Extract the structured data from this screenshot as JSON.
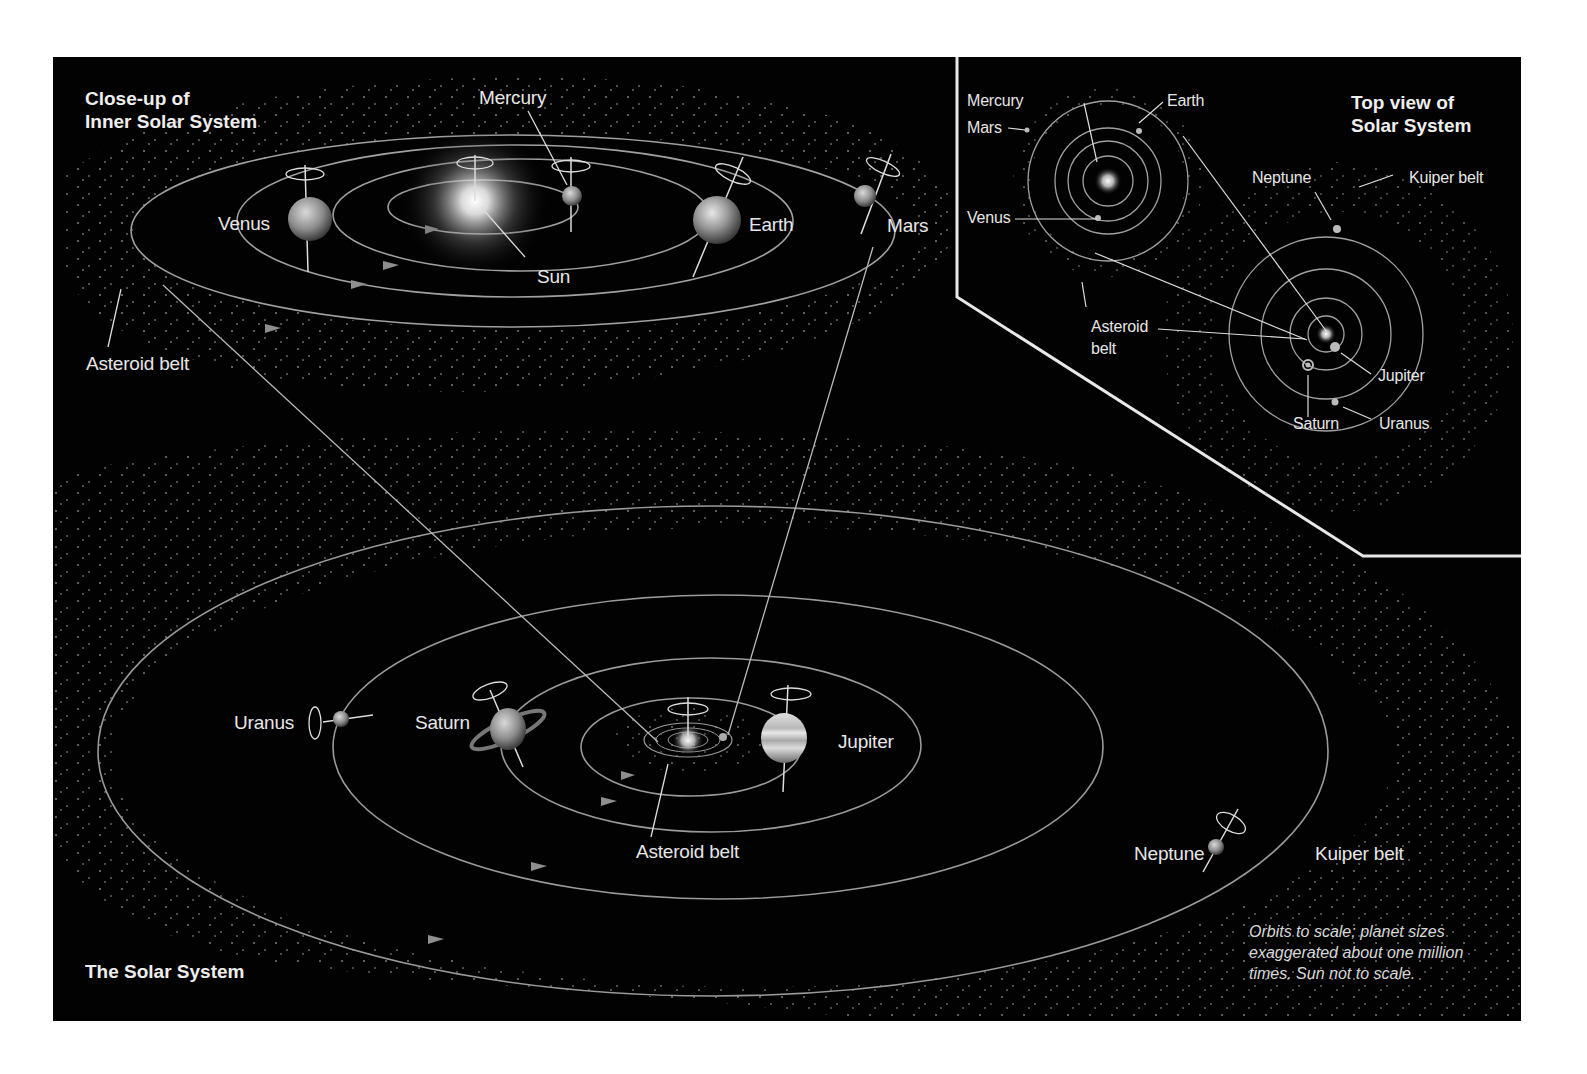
{
  "panels": {
    "inner": {
      "title": "Close-up of\nInner Solar System",
      "labels": {
        "mercury": "Mercury",
        "venus": "Venus",
        "earth": "Earth",
        "mars": "Mars",
        "sun": "Sun",
        "asteroid_belt": "Asteroid belt"
      }
    },
    "top_view": {
      "title": "Top view of\nSolar System",
      "labels": {
        "mercury": "Mercury",
        "mars": "Mars",
        "earth": "Earth",
        "venus": "Venus",
        "neptune": "Neptune",
        "kuiper_belt": "Kuiper belt",
        "asteroid_belt": "Asteroid\nbelt",
        "asteroid_line1": "Asteroid",
        "asteroid_line2": "belt",
        "jupiter": "Jupiter",
        "saturn": "Saturn",
        "uranus": "Uranus"
      }
    },
    "outer": {
      "title": "The Solar System",
      "labels": {
        "uranus": "Uranus",
        "saturn": "Saturn",
        "jupiter": "Jupiter",
        "asteroid_belt": "Asteroid belt",
        "neptune": "Neptune",
        "kuiper_belt": "Kuiper belt"
      },
      "note": "Orbits to scale; planet sizes exaggerated about one million times. Sun not to scale."
    }
  },
  "colors": {
    "background": "#020202",
    "orbit": "#9a9a9a",
    "label": "#e6e6e6",
    "page": "#ffffff"
  }
}
